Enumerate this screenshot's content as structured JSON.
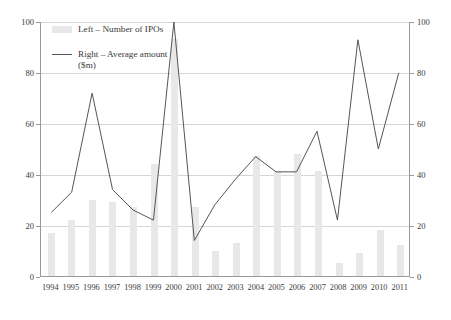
{
  "legend": {
    "position": "top-left",
    "entries": [
      {
        "marker": "bar-swatch",
        "label": "Left – Number of IPOs"
      },
      {
        "marker": "line-swatch",
        "label": "Right – Average amount\n($m)"
      }
    ]
  },
  "axes": {
    "left_ticks": [
      "0",
      "20",
      "40",
      "60",
      "80",
      "100"
    ],
    "right_ticks": [
      "0",
      "20",
      "40",
      "60",
      "80",
      "100"
    ]
  },
  "caption": "",
  "chart_data": {
    "type": "bar",
    "title": "",
    "subtitle": "",
    "xlabel": "",
    "ylabel": "",
    "y2label": "",
    "grid": true,
    "legend_position": "top-left",
    "ylim": [
      0,
      100
    ],
    "y2lim": [
      0,
      100
    ],
    "yticks": [
      0,
      20,
      40,
      60,
      80,
      100
    ],
    "y2ticks": [
      0,
      20,
      40,
      60,
      80,
      100
    ],
    "categories": [
      "1994",
      "1995",
      "1996",
      "1997",
      "1998",
      "1999",
      "2000",
      "2001",
      "2002",
      "2003",
      "2004",
      "2005",
      "2006",
      "2007",
      "2008",
      "2009",
      "2010",
      "2011"
    ],
    "series": [
      {
        "name": "Left – Number of IPOs",
        "type": "bar",
        "axis": "left",
        "color": "#e8e8e8",
        "values": [
          17,
          22,
          30,
          29,
          27,
          44,
          93,
          27,
          10,
          13,
          47,
          41,
          48,
          41,
          5,
          9,
          18,
          12
        ]
      },
      {
        "name": "Right – Average amount ($m)",
        "type": "line",
        "axis": "right",
        "color": "#555555",
        "values": [
          25,
          33,
          72,
          34,
          26,
          22,
          100,
          14,
          28,
          38,
          47,
          41,
          41,
          57,
          22,
          93,
          50,
          80
        ]
      }
    ]
  }
}
